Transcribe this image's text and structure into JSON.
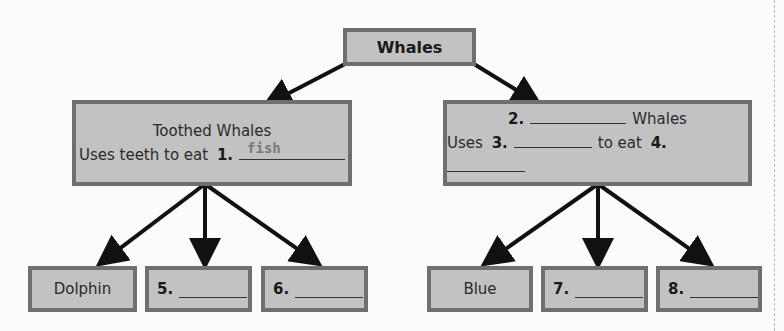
{
  "root": {
    "label": "Whales"
  },
  "branches": [
    {
      "title_prefix": "",
      "title": "Toothed Whales",
      "line2_prefix": "Uses teeth to eat",
      "item1_number": "1.",
      "item1_answer": "fish",
      "children": [
        {
          "label": "Dolphin"
        },
        {
          "number": "5.",
          "answer": ""
        },
        {
          "number": "6.",
          "answer": ""
        }
      ]
    },
    {
      "title_number": "2.",
      "title_suffix": "Whales",
      "line2_prefix": "Uses",
      "item3_number": "3.",
      "line2_middle": "to eat",
      "item4_number": "4.",
      "children": [
        {
          "label": "Blue"
        },
        {
          "number": "7.",
          "answer": ""
        },
        {
          "number": "8.",
          "answer": ""
        }
      ]
    }
  ],
  "colors": {
    "box_fill": "#c2c2c2",
    "box_border": "#6f6f6f",
    "arrow": "#111111",
    "answer_text": "#7a7a7a"
  }
}
